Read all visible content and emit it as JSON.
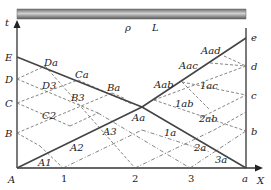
{
  "rod": {
    "density_label": "ρ",
    "length_label": "L"
  },
  "axes": {
    "t_label": "t",
    "x_label": "X"
  },
  "left_points": {
    "E": "E",
    "D": "D",
    "C": "C",
    "B": "B",
    "A": "A"
  },
  "right_points": {
    "e": "e",
    "d": "d",
    "c": "c",
    "b": "b",
    "a": "a"
  },
  "x_ticks": [
    "1",
    "2",
    "3"
  ],
  "intersection_labels": {
    "Da": "Da",
    "Ca": "Ca",
    "Ba": "Ba",
    "D3": "D3",
    "B3": "B3",
    "C2": "C2",
    "A1": "A1",
    "A2": "A2",
    "A3": "A3",
    "Aa": "Aa",
    "Aab": "Aab",
    "Aac": "Aac",
    "Aad": "Aad",
    "1ac": "1ac",
    "1ab": "1ab",
    "2ab": "2ab",
    "1a": "1a",
    "2a": "2a",
    "3a": "3a"
  },
  "colors": {
    "line": "#444444",
    "dashed": "#666666",
    "rod": "#8c8c8c"
  }
}
